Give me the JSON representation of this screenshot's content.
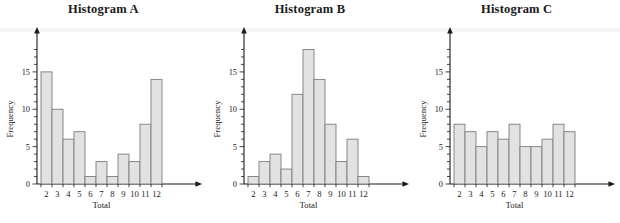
{
  "figure": {
    "background_color": "#ffffff",
    "bar_fill_color": "#e2e2e2",
    "bar_stroke_color": "#7d7d7d",
    "axis_color": "#1a1a1a"
  },
  "chart_data": [
    {
      "type": "bar",
      "title": "Histogram A",
      "xlabel": "Total",
      "ylabel": "Frequency",
      "categories": [
        "2",
        "3",
        "4",
        "5",
        "6",
        "7",
        "8",
        "9",
        "10",
        "11",
        "12"
      ],
      "values": [
        15,
        10,
        6,
        7,
        1,
        3,
        1,
        4,
        3,
        8,
        14
      ],
      "ylim": [
        0,
        19
      ],
      "ytick_labels": [
        "0",
        "5",
        "10",
        "15"
      ],
      "ytick_values": [
        0,
        5,
        10,
        15
      ],
      "minor_tick_step": 1,
      "grid": false,
      "legend": "none"
    },
    {
      "type": "bar",
      "title": "Histogram B",
      "xlabel": "Total",
      "ylabel": "Frequency",
      "categories": [
        "2",
        "3",
        "4",
        "5",
        "6",
        "7",
        "8",
        "9",
        "10",
        "11",
        "12"
      ],
      "values": [
        1,
        3,
        4,
        2,
        12,
        18,
        14,
        8,
        3,
        6,
        1
      ],
      "ylim": [
        0,
        19
      ],
      "ytick_labels": [
        "0",
        "5",
        "10",
        "15"
      ],
      "ytick_values": [
        0,
        5,
        10,
        15
      ],
      "minor_tick_step": 1,
      "grid": false,
      "legend": "none"
    },
    {
      "type": "bar",
      "title": "Histogram C",
      "xlabel": "Total",
      "ylabel": "Frequency",
      "categories": [
        "2",
        "3",
        "4",
        "5",
        "6",
        "7",
        "8",
        "9",
        "10",
        "11",
        "12"
      ],
      "values": [
        8,
        7,
        5,
        7,
        6,
        8,
        5,
        5,
        6,
        8,
        7
      ],
      "ylim": [
        0,
        19
      ],
      "ytick_labels": [
        "0",
        "5",
        "10",
        "15"
      ],
      "ytick_values": [
        0,
        5,
        10,
        15
      ],
      "minor_tick_step": 1,
      "grid": false,
      "legend": "none"
    }
  ]
}
